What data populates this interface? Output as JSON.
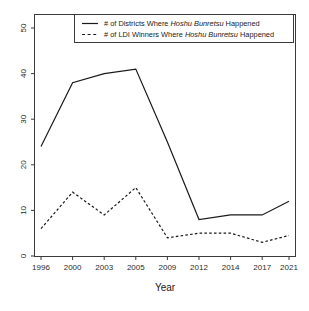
{
  "chart_data": {
    "type": "line",
    "title": "",
    "xlabel": "Year",
    "ylabel": "",
    "categories": [
      "1996",
      "2000",
      "2003",
      "2005",
      "2009",
      "2012",
      "2014",
      "2017",
      "2021"
    ],
    "x": [
      1996,
      2000,
      2003,
      2005,
      2009,
      2012,
      2014,
      2017,
      2021
    ],
    "xtick_labels": [
      "1996",
      "2000",
      "2003",
      "2005",
      "2009",
      "2012",
      "2014",
      "2017",
      "2021"
    ],
    "ytick_labels": [
      "0",
      "10",
      "20",
      "30",
      "40",
      "50"
    ],
    "yticks": [
      0,
      10,
      20,
      30,
      40,
      50
    ],
    "ylim": [
      0,
      52
    ],
    "grid": false,
    "legend_position": "top",
    "series": [
      {
        "name": "# of Districts Where Hoshu Bunretsu Happened",
        "style": "solid",
        "color": "#1a1a1a",
        "values": [
          24,
          38,
          40,
          41,
          25,
          8,
          9,
          9,
          12
        ]
      },
      {
        "name": "# of LDI Winners Where Hoshu Bunretsu Happened",
        "style": "dashed",
        "color": "#1a1a1a",
        "values": [
          6,
          14,
          9,
          15,
          4,
          5,
          5,
          3,
          4.5
        ]
      }
    ]
  },
  "legend": {
    "entries": [
      {
        "prefix": "# of Districts Where ",
        "emphasis": "Hoshu Bunretsu",
        "suffix": " Happened",
        "style": "solid"
      },
      {
        "prefix": "# of LDI Winners Where ",
        "emphasis": "Hoshu Bunretsu",
        "suffix": " Happened",
        "style": "dashed"
      }
    ]
  },
  "axes": {
    "x_title": "Year",
    "y_title": ""
  }
}
